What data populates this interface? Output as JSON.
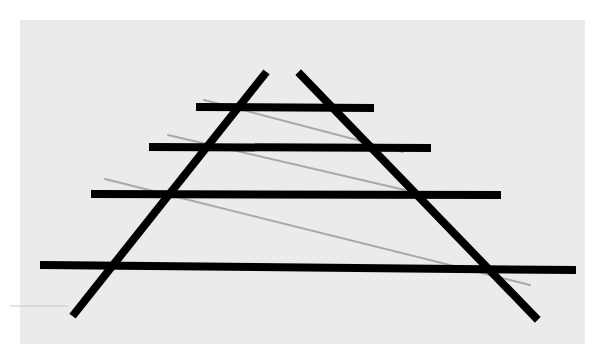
{
  "diagram": {
    "title": "",
    "kind": "ponzo-illusion",
    "colors": {
      "page_background": "#ffffff",
      "panel_background": "#ebebeb",
      "thick_line": "#000000",
      "thin_line": "#a9a9a9",
      "edge_mark": "#c8c8c8"
    },
    "panel": {
      "x": 20,
      "y": 20,
      "width": 565,
      "height": 324
    },
    "oblique_lines": [
      {
        "id": "left-rail",
        "x1": 264,
        "y1": 75,
        "x2": 75,
        "y2": 313,
        "stroke_width": 8
      },
      {
        "id": "right-rail",
        "x1": 301,
        "y1": 75,
        "x2": 535,
        "y2": 317,
        "stroke_width": 8
      }
    ],
    "horizontal_bars": [
      {
        "id": "bar-1",
        "x1": 200,
        "y1": 107,
        "x2": 370,
        "y2": 108,
        "stroke_width": 8
      },
      {
        "id": "bar-2",
        "x1": 153,
        "y1": 147,
        "x2": 427,
        "y2": 148,
        "stroke_width": 8
      },
      {
        "id": "bar-3",
        "x1": 95,
        "y1": 194,
        "x2": 497,
        "y2": 195,
        "stroke_width": 8
      },
      {
        "id": "bar-4",
        "x1": 44,
        "y1": 265,
        "x2": 572,
        "y2": 270,
        "stroke_width": 8
      }
    ],
    "thin_lines": [
      {
        "id": "thin-1",
        "x1": 204,
        "y1": 100,
        "x2": 403,
        "y2": 152,
        "stroke_width": 2
      },
      {
        "id": "thin-2",
        "x1": 168,
        "y1": 135,
        "x2": 405,
        "y2": 190,
        "stroke_width": 2
      },
      {
        "id": "thin-3",
        "x1": 105,
        "y1": 179,
        "x2": 530,
        "y2": 285,
        "stroke_width": 2
      }
    ],
    "edge_mark": {
      "x1": 10,
      "y1": 306,
      "x2": 68,
      "y2": 306,
      "stroke_width": 1
    }
  }
}
